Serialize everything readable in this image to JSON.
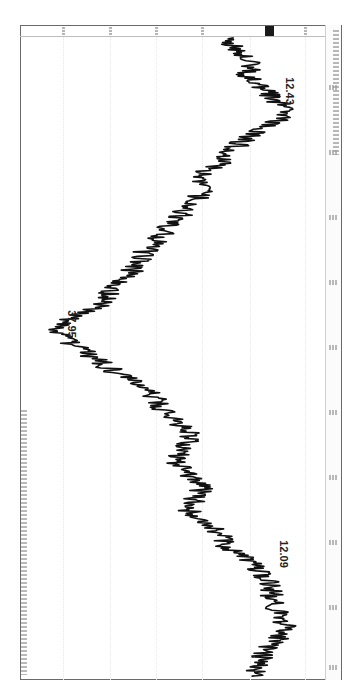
{
  "chart_data": {
    "type": "line",
    "orientation": "rotated-90-clockwise",
    "title": "",
    "xlabel": "",
    "ylabel": "",
    "grid": true,
    "legend": null,
    "annotations": [
      {
        "label": "12.09",
        "type": "low",
        "position_fraction": 0.83
      },
      {
        "label": "37.95",
        "type": "high",
        "position_fraction": 0.48
      },
      {
        "label": "12.43",
        "type": "low",
        "position_fraction": 0.12
      }
    ],
    "series": [
      {
        "name": "price",
        "points_time_fraction": [
          0.0,
          0.02,
          0.04,
          0.06,
          0.08,
          0.1,
          0.12,
          0.14,
          0.16,
          0.18,
          0.2,
          0.22,
          0.24,
          0.26,
          0.28,
          0.3,
          0.32,
          0.34,
          0.36,
          0.38,
          0.4,
          0.42,
          0.44,
          0.46,
          0.48,
          0.5,
          0.52,
          0.54,
          0.56,
          0.58,
          0.6,
          0.62,
          0.64,
          0.66,
          0.68,
          0.7,
          0.72,
          0.74,
          0.76,
          0.78,
          0.8,
          0.82,
          0.84,
          0.86,
          0.88,
          0.9,
          0.92,
          0.94,
          0.96,
          0.98,
          1.0
        ],
        "values": [
          16.0,
          15.5,
          14.6,
          13.2,
          12.43,
          13.0,
          14.1,
          13.8,
          15.2,
          16.4,
          18.9,
          19.6,
          20.8,
          23.1,
          22.4,
          21.5,
          23.7,
          24.9,
          23.5,
          22.8,
          24.6,
          26.3,
          27.1,
          29.4,
          31.8,
          33.9,
          36.2,
          37.95,
          36.5,
          33.4,
          32.0,
          30.8,
          29.1,
          28.4,
          26.9,
          25.7,
          24.2,
          22.8,
          21.4,
          22.6,
          19.8,
          18.7,
          16.9,
          14.8,
          12.09,
          13.4,
          14.9,
          16.7,
          16.2,
          17.9,
          19.1
        ]
      }
    ]
  },
  "axis": {
    "current_value_highlight": "dark-box"
  },
  "colors": {
    "line": "#111111",
    "frame": "#6a6a6a",
    "current_value_box": "#1a1a1a",
    "grid": "#e6e6e6"
  },
  "labels": {
    "annot_low_1": "12.09",
    "annot_high": "37.95",
    "annot_low_2": "12.43"
  }
}
